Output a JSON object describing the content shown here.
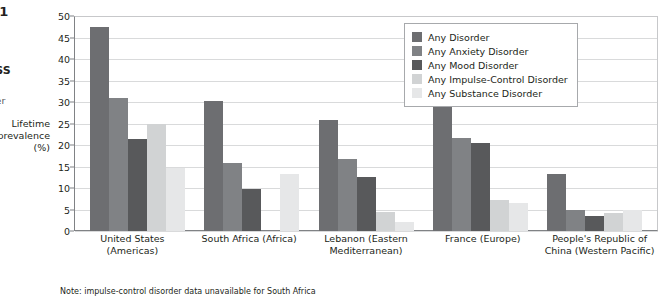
{
  "margin": {
    "figure_number": ".1",
    "source_heading": "OSS",
    "source_sub": "sler",
    "axis_title": "Lifetime prevalence (%)"
  },
  "note": "Note: impulse-control disorder data unavailable for South Africa",
  "legend": {
    "items": [
      {
        "label": "Any Disorder",
        "color": "#6d6e71"
      },
      {
        "label": "Any Anxiety Disorder",
        "color": "#808285"
      },
      {
        "label": "Any Mood Disorder",
        "color": "#58595b"
      },
      {
        "label": "Any Impulse-Control Disorder",
        "color": "#d1d3d4"
      },
      {
        "label": "Any Substance Disorder",
        "color": "#e6e7e8"
      }
    ]
  },
  "chart_data": {
    "type": "bar",
    "title": "",
    "xlabel": "",
    "ylabel": "Lifetime prevalence (%)",
    "ylim": [
      0,
      50
    ],
    "yticks": [
      0,
      5,
      10,
      15,
      20,
      25,
      30,
      35,
      40,
      45,
      50
    ],
    "grid": true,
    "legend_position": "top-right",
    "categories": [
      "United States (Americas)",
      "South Africa (Africa)",
      "Lebanon (Eastern Mediterranean)",
      "France (Europe)",
      "People's Republic of China (Western Pacific)"
    ],
    "series": [
      {
        "name": "Any Disorder",
        "color": "#6d6e71",
        "values": [
          47.4,
          30.3,
          25.8,
          37.9,
          13.2
        ]
      },
      {
        "name": "Any Anxiety Disorder",
        "color": "#808285",
        "values": [
          31.0,
          15.8,
          16.7,
          21.6,
          4.8
        ]
      },
      {
        "name": "Any Mood Disorder",
        "color": "#58595b",
        "values": [
          21.4,
          9.8,
          12.6,
          20.5,
          3.6
        ]
      },
      {
        "name": "Any Impulse-Control Disorder",
        "color": "#d1d3d4",
        "values": [
          25.0,
          null,
          4.4,
          7.1,
          4.3
        ]
      },
      {
        "name": "Any Substance Disorder",
        "color": "#e6e7e8",
        "values": [
          14.6,
          13.3,
          2.2,
          6.6,
          4.9
        ]
      }
    ]
  }
}
